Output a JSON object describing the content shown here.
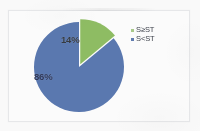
{
  "chart_data": {
    "type": "pie",
    "title": "",
    "subtitle": "",
    "xlabel": "",
    "ylabel": "",
    "grid": false,
    "legend_position": "right-top",
    "labels": [
      "S≥ST",
      "S<ST"
    ],
    "values": [
      14,
      86
    ],
    "value_unit": "%",
    "data_labels": [
      "14%",
      "86%"
    ],
    "colors": [
      "#8cbf5c",
      "#5778b5"
    ],
    "start_angle_deg": 0,
    "direction": "clockwise",
    "exploded_slices": [
      "S≥ST"
    ],
    "slices": [
      {
        "label": "S≥ST",
        "value": 14,
        "data_label": "14%",
        "color": "#8cbf5c",
        "legend_marker_color": "#a8cc86",
        "exploded": true
      },
      {
        "label": "S<ST",
        "value": 86,
        "data_label": "86%",
        "color": "#5778b5",
        "legend_marker_color": "#5e7cb6",
        "exploded": false
      }
    ]
  },
  "legend": {
    "items": [
      {
        "label": "S≥ST",
        "marker": "square-marker-green"
      },
      {
        "label": "S<ST",
        "marker": "square-marker-blue"
      }
    ]
  },
  "labels": {
    "green_slice": "14%",
    "blue_slice": "86%"
  },
  "colors": {
    "slice_green": "#8cbf5c",
    "slice_blue": "#5778b5",
    "frame_border": "#e9eaec",
    "page_background": "#fdfdfd",
    "plot_background": "#ffffff",
    "label_text": "#2b3458"
  }
}
